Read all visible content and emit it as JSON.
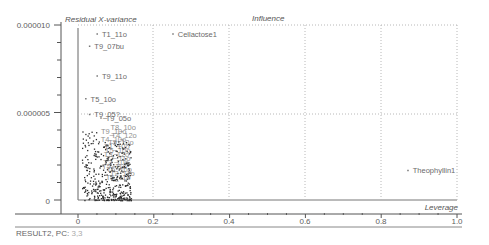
{
  "chart_data": {
    "type": "scatter",
    "title": "Influence",
    "xlabel": "Leverage",
    "ylabel": "Residual X-variance",
    "xlim": [
      0,
      1.0
    ],
    "ylim": [
      0,
      1e-05
    ],
    "x_ticks": [
      "0",
      "0.2",
      "0.4",
      "0.6",
      "0.8",
      "1.0"
    ],
    "y_ticks": [
      "0",
      "0.000005",
      "0.000010"
    ],
    "grid": true,
    "legend": null,
    "labeled_points": [
      {
        "label": "T1_11o",
        "x": 0.05,
        "y": 9.5e-06
      },
      {
        "label": "Cellactose1",
        "x": 0.25,
        "y": 9.5e-06
      },
      {
        "label": "T9_07bu",
        "x": 0.03,
        "y": 8.8e-06
      },
      {
        "label": "T9_11o",
        "x": 0.05,
        "y": 7.1e-06
      },
      {
        "label": "T5_10o",
        "x": 0.02,
        "y": 5.8e-06
      },
      {
        "label": "T9_05?",
        "x": 0.03,
        "y": 4.9e-06
      },
      {
        "label": "T9_05o",
        "x": 0.06,
        "y": 4.7e-06
      },
      {
        "label": "Theophyllin1",
        "x": 0.87,
        "y": 1.7e-06
      }
    ],
    "cluster": {
      "x_range": [
        0.01,
        0.14
      ],
      "y_range": [
        0,
        4e-06
      ],
      "approx_points": 400
    }
  },
  "footer": {
    "result": "RESULT2, PC:",
    "pc": "3,3"
  }
}
